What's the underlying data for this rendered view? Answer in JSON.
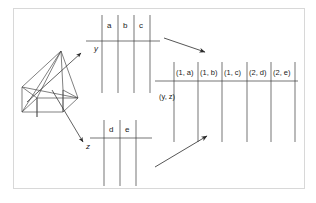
{
  "figure": {
    "background_color": "#ffffff",
    "frame_color": "#d8d8d8",
    "line_color": "#3a3a3a",
    "text_color": "#1a1a1a"
  },
  "object": {
    "name": "wireframe-prism",
    "description": "3D wireframe polyhedron (prism/pyramid) drawn in oblique projection"
  },
  "axes": [
    {
      "id": "y",
      "label": "y",
      "direction": "up-right"
    },
    {
      "id": "z",
      "label": "z",
      "direction": "down-right"
    }
  ],
  "tables": {
    "top": {
      "name": "top-attribute-table",
      "headers": [
        "a",
        "b",
        "c"
      ],
      "column_count": 3,
      "vertical_line_count": 4
    },
    "bottom": {
      "name": "bottom-attribute-table",
      "headers": [
        "d",
        "e"
      ],
      "column_count": 2,
      "vertical_line_count": 3
    },
    "result": {
      "name": "result-tuple-table",
      "headers": [
        "(1, a)",
        "(1, b)",
        "(1, c)",
        "(2, d)",
        "(2, e)"
      ],
      "row_label": "(y, z)",
      "column_count": 5,
      "vertical_line_count": 6
    }
  },
  "arrows": [
    {
      "id": "top-to-result",
      "from": "top-attribute-table",
      "to": "result-tuple-table",
      "direction": "down-right"
    },
    {
      "id": "bottom-to-result",
      "from": "bottom-attribute-table",
      "to": "result-tuple-table",
      "direction": "up-right"
    },
    {
      "id": "y-axis-arrow",
      "direction": "up-right"
    },
    {
      "id": "z-axis-arrow",
      "direction": "down-right"
    }
  ]
}
